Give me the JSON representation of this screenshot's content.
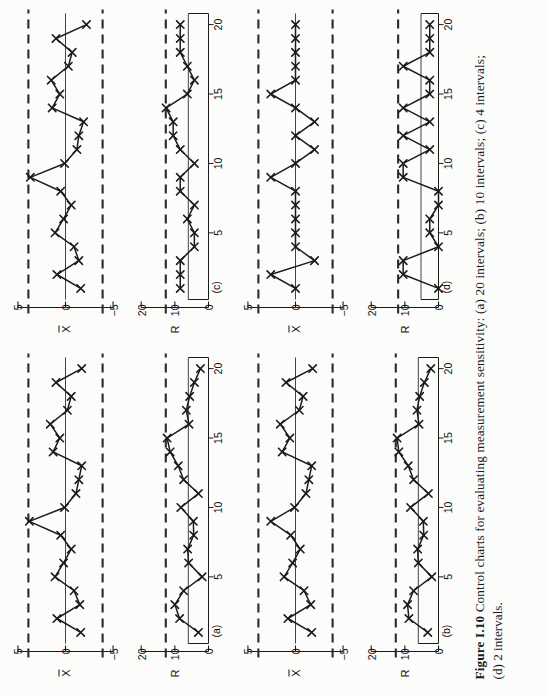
{
  "figure": {
    "number": "Figure I.10",
    "caption_line1": "Control  charts  for  evaluating  measurement  sensitivity:  (a)  20  intervals;  (b) 10 intervals; (c) 4 intervals;",
    "caption_line2": "(d) 2 intervals."
  },
  "axes": {
    "xbar_name": "X",
    "r_name": "R",
    "xbar_ticks": [
      "5",
      "0",
      "−5"
    ],
    "r_ticks": [
      "20",
      "10",
      "0"
    ],
    "x_ticks": [
      "5",
      "10",
      "15",
      "20"
    ],
    "xbar_ylim": [
      -6.2,
      6.2
    ],
    "r_ylim": [
      0,
      22
    ],
    "xlim": [
      0.2,
      20.8
    ]
  },
  "colors": {
    "ink": "#1b1b1b",
    "limit": "#2a2a2a",
    "center": "#444444",
    "paper": "#fcfcfa"
  },
  "panels": [
    {
      "key": "a",
      "label": "(a)",
      "intervals": 20
    },
    {
      "key": "b",
      "label": "(b)",
      "intervals": 10
    },
    {
      "key": "c",
      "label": "(c)",
      "intervals": 4
    },
    {
      "key": "d",
      "label": "(d)",
      "intervals": 2
    }
  ],
  "chart_data": [
    {
      "type": "line",
      "id": "a-xbar",
      "panel": "(a)",
      "title": "X-bar chart, 20 intervals",
      "xlabel": "Sample number",
      "ylabel": "X",
      "x": [
        1,
        2,
        3,
        4,
        5,
        6,
        7,
        8,
        9,
        10,
        11,
        12,
        13,
        14,
        15,
        16,
        17,
        18,
        19,
        20
      ],
      "values": [
        -1.6,
        0.9,
        -1.5,
        -0.9,
        1.1,
        0.2,
        -0.6,
        0.5,
        3.8,
        0.1,
        -1.1,
        -1.4,
        -1.7,
        1.3,
        0.6,
        1.6,
        -0.2,
        -0.6,
        1.0,
        -1.7
      ],
      "center_line": 0,
      "upper_limit": 3.9,
      "lower_limit": -3.9,
      "ylim": [
        -6.2,
        6.2
      ],
      "grid": false
    },
    {
      "type": "line",
      "id": "a-r",
      "panel": "(a)",
      "title": "R chart, 20 intervals",
      "xlabel": "Sample number",
      "ylabel": "R",
      "x": [
        1,
        2,
        3,
        4,
        5,
        6,
        7,
        8,
        9,
        10,
        11,
        12,
        13,
        14,
        15,
        16,
        17,
        18,
        19,
        20
      ],
      "values": [
        3.0,
        8.6,
        10.0,
        7.4,
        1.9,
        5.9,
        6.2,
        4.4,
        4.5,
        8.2,
        3.0,
        7.4,
        9.0,
        11.4,
        12.3,
        5.8,
        6.6,
        5.6,
        4.2,
        2.4
      ],
      "center_line": 6.0,
      "upper_limit": 12.7,
      "lower_limit": 0,
      "ylim": [
        0,
        22
      ],
      "grid": false
    },
    {
      "type": "line",
      "id": "b-xbar",
      "panel": "(b)",
      "title": "X-bar chart, 10 intervals",
      "xlabel": "Sample number",
      "ylabel": "X",
      "x": [
        1,
        2,
        3,
        4,
        5,
        6,
        7,
        8,
        9,
        10,
        11,
        12,
        13,
        14,
        15,
        16,
        17,
        18,
        19,
        20
      ],
      "values": [
        -1.7,
        0.8,
        -1.6,
        -0.9,
        1.2,
        0.3,
        -0.5,
        0.5,
        2.6,
        0.1,
        -1.1,
        -1.4,
        -1.7,
        1.4,
        0.6,
        1.6,
        -0.4,
        -0.8,
        1.0,
        -1.8
      ],
      "center_line": 0,
      "upper_limit": 3.9,
      "lower_limit": -3.9,
      "ylim": [
        -6.2,
        6.2
      ],
      "grid": false
    },
    {
      "type": "line",
      "id": "b-r",
      "panel": "(b)",
      "title": "R chart, 10 intervals",
      "xlabel": "Sample number",
      "ylabel": "R",
      "x": [
        1,
        2,
        3,
        4,
        5,
        6,
        7,
        8,
        9,
        10,
        11,
        12,
        13,
        14,
        15,
        16,
        17,
        18,
        19,
        20
      ],
      "values": [
        3.2,
        8.8,
        9.2,
        7.4,
        2.0,
        6.0,
        6.2,
        4.4,
        4.5,
        8.3,
        3.0,
        7.4,
        9.0,
        11.8,
        12.3,
        5.8,
        6.4,
        5.6,
        4.2,
        2.3
      ],
      "center_line": 6.0,
      "upper_limit": 12.7,
      "lower_limit": 0,
      "ylim": [
        0,
        22
      ],
      "grid": false
    },
    {
      "type": "line",
      "id": "c-xbar",
      "panel": "(c)",
      "title": "X-bar chart, 4 intervals",
      "xlabel": "Sample number",
      "ylabel": "X",
      "x": [
        1,
        2,
        3,
        4,
        5,
        6,
        7,
        8,
        9,
        10,
        11,
        12,
        13,
        14,
        15,
        16,
        17,
        18,
        19,
        20
      ],
      "values": [
        -1.6,
        0.9,
        -1.4,
        -0.9,
        1.1,
        0.2,
        -0.6,
        0.5,
        3.7,
        0.1,
        -1.2,
        -1.4,
        -1.9,
        1.4,
        0.6,
        1.5,
        -0.3,
        -0.7,
        1.0,
        -2.2
      ],
      "center_line": 0,
      "upper_limit": 3.9,
      "lower_limit": -3.9,
      "ylim": [
        -6.2,
        6.2
      ],
      "grid": false
    },
    {
      "type": "line",
      "id": "c-r",
      "panel": "(c)",
      "title": "R chart, 4 intervals",
      "xlabel": "Sample number",
      "ylabel": "R",
      "x": [
        1,
        2,
        3,
        4,
        5,
        6,
        7,
        8,
        9,
        10,
        11,
        12,
        13,
        14,
        15,
        16,
        17,
        18,
        19,
        20
      ],
      "values": [
        8.4,
        8.4,
        8.4,
        4.2,
        4.2,
        6.3,
        4.2,
        8.4,
        8.4,
        4.2,
        8.4,
        10.5,
        10.5,
        12.6,
        6.3,
        4.2,
        6.3,
        8.4,
        8.4,
        8.4
      ],
      "center_line": 6.0,
      "upper_limit": 12.7,
      "lower_limit": 0,
      "ylim": [
        0,
        22
      ],
      "grid": false
    },
    {
      "type": "line",
      "id": "d-xbar",
      "panel": "(d)",
      "title": "X-bar chart, 2 intervals",
      "xlabel": "Sample number",
      "ylabel": "X",
      "x": [
        1,
        2,
        3,
        4,
        5,
        6,
        7,
        8,
        9,
        10,
        11,
        12,
        13,
        14,
        15,
        16,
        17,
        18,
        19,
        20
      ],
      "values": [
        0.0,
        2.6,
        -2.0,
        0.0,
        0.0,
        0.0,
        0.0,
        0.0,
        2.6,
        0.0,
        -2.0,
        0.0,
        -2.0,
        0.0,
        2.6,
        0.0,
        0.0,
        0.0,
        0.0,
        0.0
      ],
      "center_line": 0,
      "upper_limit": 3.9,
      "lower_limit": -3.9,
      "ylim": [
        -6.2,
        6.2
      ],
      "grid": false
    },
    {
      "type": "line",
      "id": "d-r",
      "panel": "(d)",
      "title": "R chart, 2 intervals",
      "xlabel": "Sample number",
      "ylabel": "R",
      "x": [
        1,
        2,
        3,
        4,
        5,
        6,
        7,
        8,
        9,
        10,
        11,
        12,
        13,
        14,
        15,
        16,
        17,
        18,
        19,
        20
      ],
      "values": [
        0.0,
        10.5,
        10.5,
        0.0,
        2.6,
        2.6,
        0.0,
        0.0,
        10.5,
        10.5,
        2.6,
        10.5,
        2.6,
        10.5,
        2.6,
        2.6,
        10.5,
        2.6,
        2.6,
        2.6
      ],
      "center_line": 5.2,
      "upper_limit": 12.0,
      "lower_limit": 0,
      "ylim": [
        0,
        22
      ],
      "grid": false
    }
  ]
}
